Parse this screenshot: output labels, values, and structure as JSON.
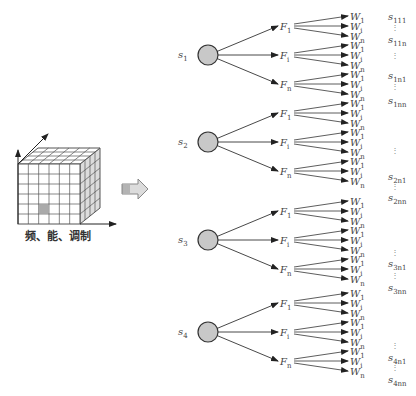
{
  "cube": {
    "caption": "频、能、调制",
    "grid_rows": 6,
    "grid_cols": 6,
    "highlight_cell": [
      3,
      4
    ],
    "colors": {
      "line": "#555555",
      "side_fill": "#dddddd",
      "highlight": "#aaaaaa"
    }
  },
  "transition_arrow": {
    "shape": "block-arrow",
    "fill": "#dcdcdc"
  },
  "node_fill": "#c8c8c8",
  "states": [
    {
      "label": "s",
      "sub": "1",
      "features": [
        {
          "label": "F",
          "sub": "1",
          "weights": [
            {
              "label": "W",
              "sub": "1"
            },
            {
              "label": "W",
              "sub": "i"
            },
            {
              "label": "W",
              "sub": "n"
            }
          ]
        },
        {
          "label": "F",
          "sub": "i",
          "weights": [
            {
              "label": "W",
              "sub": "1"
            },
            {
              "label": "W",
              "sub": "i"
            },
            {
              "label": "W",
              "sub": "n"
            }
          ]
        },
        {
          "label": "F",
          "sub": "n",
          "weights": [
            {
              "label": "W",
              "sub": "1"
            },
            {
              "label": "W",
              "sub": "i"
            },
            {
              "label": "W",
              "sub": "n"
            }
          ]
        }
      ],
      "outputs": [
        {
          "label": "s",
          "sub": "111"
        },
        {
          "dots": true
        },
        {
          "label": "s",
          "sub": "11n"
        },
        {
          "dots": true
        },
        {
          "label": "s",
          "sub": "1n1"
        },
        {
          "dots": true
        },
        {
          "label": "s",
          "sub": "1nn"
        }
      ]
    },
    {
      "label": "s",
      "sub": "2",
      "features": [
        {
          "label": "F",
          "sub": "1",
          "weights": [
            {
              "label": "W",
              "sub": "1"
            },
            {
              "label": "W",
              "sub": "i"
            },
            {
              "label": "W",
              "sub": "n"
            }
          ]
        },
        {
          "label": "F",
          "sub": "i",
          "weights": [
            {
              "label": "W",
              "sub": "1"
            },
            {
              "label": "W",
              "sub": "i"
            },
            {
              "label": "W",
              "sub": "n"
            }
          ]
        },
        {
          "label": "F",
          "sub": "n",
          "weights": [
            {
              "label": "W",
              "sub": "1"
            },
            {
              "label": "W",
              "sub": "i"
            },
            {
              "label": "W",
              "sub": "n"
            }
          ]
        }
      ],
      "outputs": [
        {
          "dots": true
        },
        {
          "label": "s",
          "sub": "2n1"
        },
        {
          "dots": true
        },
        {
          "label": "s",
          "sub": "2nn"
        }
      ]
    },
    {
      "label": "s",
      "sub": "3",
      "features": [
        {
          "label": "F",
          "sub": "1",
          "weights": [
            {
              "label": "W",
              "sub": "1"
            },
            {
              "label": "W",
              "sub": "i"
            },
            {
              "label": "W",
              "sub": "n"
            }
          ]
        },
        {
          "label": "F",
          "sub": "i",
          "weights": [
            {
              "label": "W",
              "sub": "1"
            },
            {
              "label": "W",
              "sub": "i"
            },
            {
              "label": "W",
              "sub": "n"
            }
          ]
        },
        {
          "label": "F",
          "sub": "n",
          "weights": [
            {
              "label": "W",
              "sub": "1"
            },
            {
              "label": "W",
              "sub": "i"
            },
            {
              "label": "W",
              "sub": "n"
            }
          ]
        }
      ],
      "outputs": [
        {
          "dots": true
        },
        {
          "label": "s",
          "sub": "3n1"
        },
        {
          "dots": true
        },
        {
          "label": "s",
          "sub": "3nn"
        }
      ]
    },
    {
      "label": "s",
      "sub": "4",
      "features": [
        {
          "label": "F",
          "sub": "1",
          "weights": [
            {
              "label": "W",
              "sub": "1"
            },
            {
              "label": "W",
              "sub": "i"
            },
            {
              "label": "W",
              "sub": "n"
            }
          ]
        },
        {
          "label": "F",
          "sub": "i",
          "weights": [
            {
              "label": "W",
              "sub": "1"
            },
            {
              "label": "W",
              "sub": "i"
            },
            {
              "label": "W",
              "sub": "n"
            }
          ]
        },
        {
          "label": "F",
          "sub": "n",
          "weights": [
            {
              "label": "W",
              "sub": "1"
            },
            {
              "label": "W",
              "sub": "i"
            },
            {
              "label": "W",
              "sub": "n"
            }
          ]
        }
      ],
      "outputs": [
        {
          "dots": true
        },
        {
          "label": "s",
          "sub": "4n1"
        },
        {
          "dots": true
        },
        {
          "label": "s",
          "sub": "4nn"
        }
      ]
    }
  ]
}
